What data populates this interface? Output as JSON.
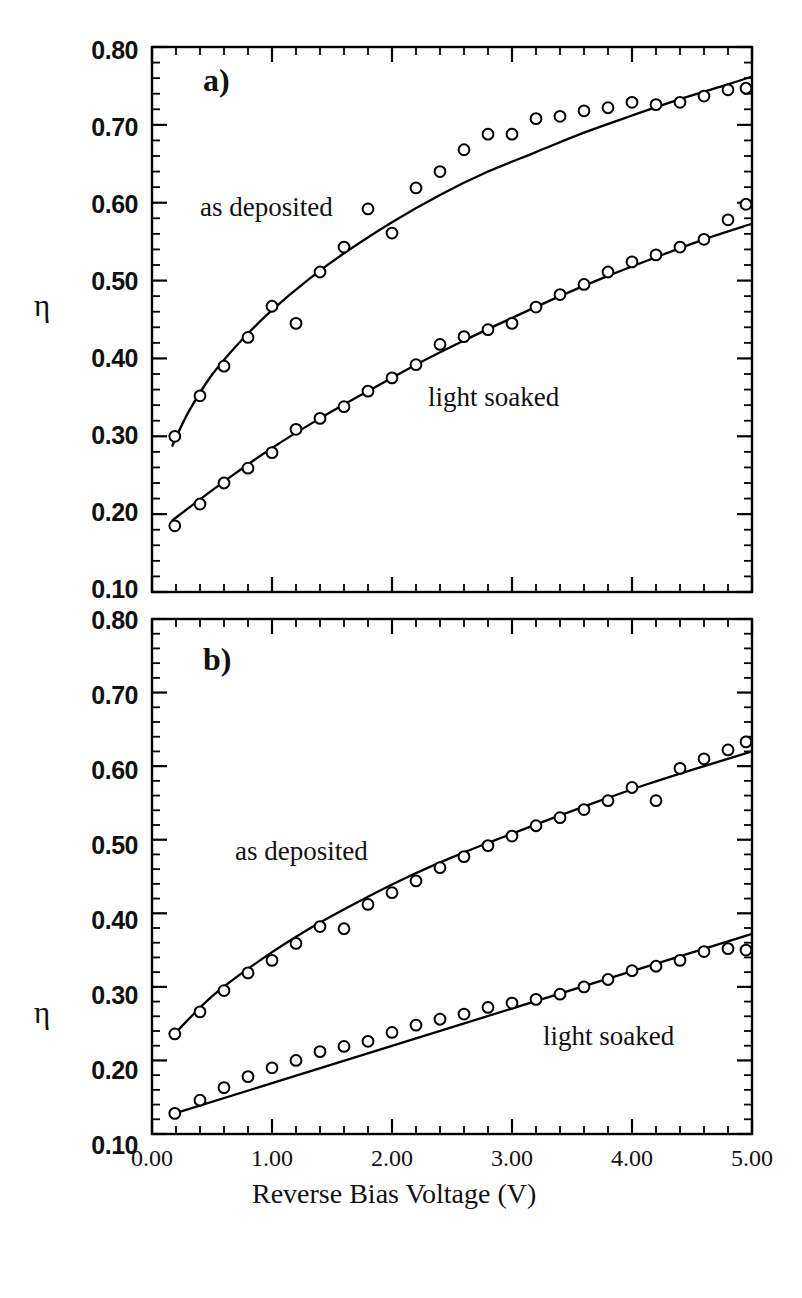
{
  "figure": {
    "background": "#ffffff",
    "ink": "#000000",
    "xaxis": {
      "title": "Reverse Bias Voltage (V)",
      "min": 0.0,
      "max": 5.0,
      "major_ticks": [
        0.0,
        1.0,
        2.0,
        3.0,
        4.0,
        5.0
      ],
      "tick_labels": [
        "0.00",
        "1.00",
        "2.00",
        "3.00",
        "4.00",
        "5.00"
      ],
      "minor_per_major": 5
    },
    "yaxis": {
      "title": "η",
      "min": 0.1,
      "max": 0.8,
      "major_ticks": [
        0.1,
        0.2,
        0.3,
        0.4,
        0.5,
        0.6,
        0.7,
        0.8
      ],
      "tick_labels": [
        "0.10",
        "0.20",
        "0.30",
        "0.40",
        "0.50",
        "0.60",
        "0.70",
        "0.80"
      ],
      "minor_per_major": 5
    }
  },
  "chart_data": [
    {
      "type": "scatter",
      "panel": "a)",
      "title": "",
      "xlabel": "Reverse Bias Voltage (V)",
      "ylabel": "η",
      "xlim": [
        0.0,
        5.0
      ],
      "ylim": [
        0.1,
        0.8
      ],
      "grid": false,
      "legend_position": "inline-annotations",
      "annotations": [
        {
          "text": "a)",
          "x": 0.45,
          "y": 0.755
        },
        {
          "text": "as deposited",
          "x": 0.42,
          "y": 0.603
        },
        {
          "text": "light soaked",
          "x": 2.3,
          "y": 0.327
        }
      ],
      "series": [
        {
          "name": "as deposited",
          "marker": "open-circle",
          "points_x": [
            0.19,
            0.4,
            0.6,
            0.8,
            1.0,
            1.2,
            1.4,
            1.6,
            1.8,
            2.0,
            2.2,
            2.4,
            2.6,
            2.8,
            3.0,
            3.2,
            3.4,
            3.6,
            3.8,
            4.0,
            4.2,
            4.4,
            4.6,
            4.8,
            4.95
          ],
          "points_y": [
            0.3,
            0.352,
            0.39,
            0.427,
            0.467,
            0.445,
            0.511,
            0.543,
            0.592,
            0.561,
            0.619,
            0.64,
            0.668,
            0.688,
            0.688,
            0.708,
            0.711,
            0.718,
            0.722,
            0.729,
            0.726,
            0.729,
            0.737,
            0.745,
            0.747
          ],
          "fit_curve": {
            "kind": "saturating",
            "x": [
              0.17,
              0.3,
              0.5,
              0.75,
              1.0,
              1.3,
              1.6,
              2.0,
              2.4,
              2.8,
              3.2,
              3.6,
              4.0,
              4.4,
              4.8,
              5.0
            ],
            "y": [
              0.288,
              0.33,
              0.379,
              0.424,
              0.462,
              0.501,
              0.535,
              0.575,
              0.61,
              0.64,
              0.665,
              0.69,
              0.712,
              0.733,
              0.752,
              0.762
            ]
          }
        },
        {
          "name": "light soaked",
          "marker": "open-circle",
          "points_x": [
            0.19,
            0.4,
            0.6,
            0.8,
            1.0,
            1.2,
            1.4,
            1.6,
            1.8,
            2.0,
            2.2,
            2.4,
            2.6,
            2.8,
            3.0,
            3.2,
            3.4,
            3.6,
            3.8,
            4.0,
            4.2,
            4.4,
            4.6,
            4.8,
            4.95
          ],
          "points_y": [
            0.185,
            0.213,
            0.24,
            0.259,
            0.279,
            0.309,
            0.323,
            0.338,
            0.358,
            0.375,
            0.392,
            0.418,
            0.428,
            0.437,
            0.445,
            0.466,
            0.482,
            0.495,
            0.511,
            0.524,
            0.533,
            0.543,
            0.553,
            0.578,
            0.598
          ],
          "fit_curve": {
            "kind": "saturating",
            "x": [
              0.17,
              0.4,
              0.7,
              1.0,
              1.4,
              1.8,
              2.2,
              2.6,
              3.0,
              3.4,
              3.8,
              4.2,
              4.6,
              5.0
            ],
            "y": [
              0.192,
              0.219,
              0.253,
              0.285,
              0.323,
              0.358,
              0.392,
              0.423,
              0.452,
              0.48,
              0.506,
              0.53,
              0.553,
              0.573
            ]
          }
        }
      ]
    },
    {
      "type": "scatter",
      "panel": "b)",
      "title": "",
      "xlabel": "Reverse Bias Voltage (V)",
      "ylabel": "η",
      "xlim": [
        0.0,
        5.0
      ],
      "ylim": [
        0.1,
        0.8
      ],
      "grid": false,
      "legend_position": "inline-annotations",
      "annotations": [
        {
          "text": "b)",
          "x": 0.45,
          "y": 0.745
        },
        {
          "text": "as deposited",
          "x": 0.72,
          "y": 0.507
        },
        {
          "text": "light soaked",
          "x": 3.27,
          "y": 0.262
        }
      ],
      "series": [
        {
          "name": "as deposited",
          "marker": "open-circle",
          "points_x": [
            0.19,
            0.4,
            0.6,
            0.8,
            1.0,
            1.2,
            1.4,
            1.6,
            1.8,
            2.0,
            2.2,
            2.4,
            2.6,
            2.8,
            3.0,
            3.2,
            3.4,
            3.6,
            3.8,
            4.0,
            4.2,
            4.4,
            4.6,
            4.8,
            4.95
          ],
          "points_y": [
            0.236,
            0.266,
            0.295,
            0.319,
            0.336,
            0.359,
            0.382,
            0.379,
            0.412,
            0.428,
            0.444,
            0.462,
            0.477,
            0.492,
            0.505,
            0.519,
            0.53,
            0.541,
            0.553,
            0.571,
            0.553,
            0.597,
            0.61,
            0.622,
            0.633
          ],
          "fit_curve": {
            "kind": "saturating",
            "x": [
              0.17,
              0.5,
              0.9,
              1.3,
              1.7,
              2.1,
              2.5,
              2.9,
              3.3,
              3.7,
              4.1,
              4.5,
              5.0
            ],
            "y": [
              0.233,
              0.287,
              0.336,
              0.378,
              0.414,
              0.447,
              0.476,
              0.502,
              0.527,
              0.551,
              0.574,
              0.595,
              0.62
            ]
          }
        },
        {
          "name": "light soaked",
          "marker": "open-circle",
          "points_x": [
            0.19,
            0.4,
            0.6,
            0.8,
            1.0,
            1.2,
            1.4,
            1.6,
            1.8,
            2.0,
            2.2,
            2.4,
            2.6,
            2.8,
            3.0,
            3.2,
            3.4,
            3.6,
            3.8,
            4.0,
            4.2,
            4.4,
            4.6,
            4.8,
            4.95
          ],
          "points_y": [
            0.128,
            0.146,
            0.163,
            0.178,
            0.19,
            0.2,
            0.212,
            0.219,
            0.226,
            0.238,
            0.248,
            0.256,
            0.263,
            0.272,
            0.278,
            0.283,
            0.29,
            0.3,
            0.31,
            0.322,
            0.328,
            0.336,
            0.348,
            0.352,
            0.35
          ],
          "fit_curve": {
            "kind": "linear",
            "x": [
              0.17,
              5.0
            ],
            "y": [
              0.127,
              0.372
            ]
          }
        }
      ]
    }
  ]
}
